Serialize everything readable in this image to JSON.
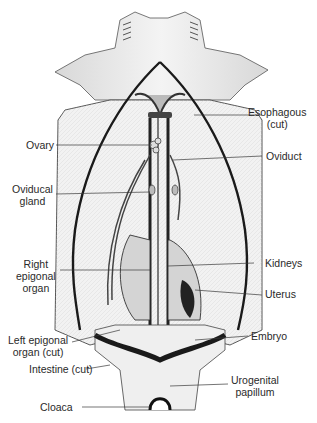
{
  "figure": {
    "colors": {
      "background": "#ffffff",
      "ink": "#2a2a2a",
      "shading": "#bdbdbd",
      "dark": "#1a1a1a"
    }
  },
  "labels": {
    "esophagous": {
      "line1": "Esophagous",
      "line2": "(cut)"
    },
    "ovary": {
      "line1": "Ovary"
    },
    "oviduct": {
      "line1": "Oviduct"
    },
    "oviducal_gland": {
      "line1": "Oviducal",
      "line2": "gland"
    },
    "right_epigonal": {
      "line1": "Right",
      "line2": "epigonal",
      "line3": "organ"
    },
    "kidneys": {
      "line1": "Kidneys"
    },
    "uterus": {
      "line1": "Uterus"
    },
    "left_epigonal": {
      "line1": "Left epigonal",
      "line2": "organ (cut)"
    },
    "embryo": {
      "line1": "Embryo"
    },
    "intestine": {
      "line1": "Intestine (cut)"
    },
    "urogenital": {
      "line1": "Urogenital",
      "line2": "papillum"
    },
    "cloaca": {
      "line1": "Cloaca"
    }
  }
}
